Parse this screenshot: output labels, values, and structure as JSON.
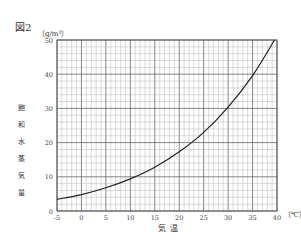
{
  "figure": {
    "label": "図2",
    "y_unit": "〔g/m³〕",
    "x_unit": "〔℃〕",
    "ylabel_chars": [
      "飽",
      "和",
      "水",
      "蒸",
      "気",
      "量"
    ],
    "xlabel": "気温"
  },
  "chart_data": {
    "type": "line",
    "title": "図2",
    "xlabel": "気温",
    "ylabel": "飽和水蒸気量",
    "x_unit": "℃",
    "y_unit": "g/m³",
    "xlim": [
      -5,
      40
    ],
    "ylim": [
      0,
      50
    ],
    "x_ticks": [
      -5,
      0,
      5,
      10,
      15,
      20,
      25,
      30,
      35,
      40
    ],
    "y_ticks": [
      0,
      10,
      20,
      30,
      40,
      50
    ],
    "grid": true,
    "legend": null,
    "series": [
      {
        "name": "飽和水蒸気量",
        "x": [
          -5,
          0,
          5,
          10,
          15,
          20,
          25,
          30,
          35,
          39.5
        ],
        "values": [
          3.4,
          4.8,
          6.8,
          9.4,
          12.8,
          17.3,
          23.0,
          30.4,
          39.6,
          50.0
        ]
      }
    ]
  }
}
